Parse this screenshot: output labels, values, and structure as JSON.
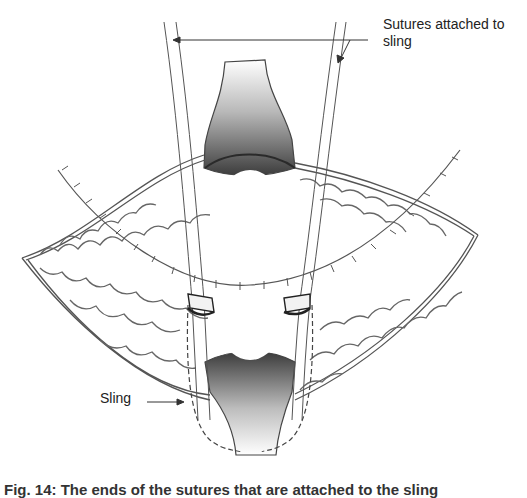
{
  "figure": {
    "labels": {
      "sutures": "Sutures attached to sling",
      "sling": "Sling"
    },
    "caption": "Fig. 14: The ends of the sutures that are attached to the sling",
    "colors": {
      "line": "#444444",
      "shade_dark": "#3a3a3a",
      "shade_light": "#f2f2f2",
      "background": "#ffffff"
    }
  }
}
